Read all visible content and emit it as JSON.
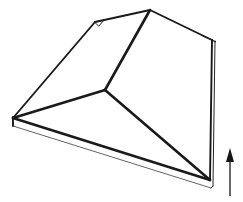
{
  "figure": {
    "title": "Hip roof slab line drawing",
    "type": "line-drawing",
    "background_color": "#ffffff",
    "line_color": "#1a1a1a",
    "canvas": {
      "width": 243,
      "height": 202
    },
    "annotation": {
      "arrow_direction": "up",
      "arrow_label": "",
      "arrow_color": "#161616",
      "arrow_x": 230,
      "arrow_tail_y": 196,
      "arrow_tip_y": 150
    },
    "geometry": {
      "apex": [
        150,
        10
      ],
      "ridge_junction": [
        105,
        90
      ],
      "left_corner": [
        13,
        118
      ],
      "right_corner": [
        210,
        180
      ],
      "top_left_corner": [
        95,
        22
      ],
      "top_right_corner": [
        212,
        40
      ],
      "slab_thickness": 8,
      "edges": [
        {
          "name": "roof-left-rake",
          "from": [
            13,
            118
          ],
          "to": [
            95,
            22
          ]
        },
        {
          "name": "roof-top-left-eave",
          "from": [
            95,
            22
          ],
          "to": [
            150,
            10
          ]
        },
        {
          "name": "roof-top-right-eave",
          "from": [
            150,
            10
          ],
          "to": [
            212,
            40
          ]
        },
        {
          "name": "hip-apex-to-junction",
          "from": [
            150,
            10
          ],
          "to": [
            105,
            90
          ]
        },
        {
          "name": "hip-junction-to-left",
          "from": [
            105,
            90
          ],
          "to": [
            13,
            118
          ]
        },
        {
          "name": "hip-junction-to-right",
          "from": [
            105,
            90
          ],
          "to": [
            210,
            180
          ]
        },
        {
          "name": "slab-front-edge",
          "from": [
            13,
            118
          ],
          "to": [
            210,
            180
          ]
        },
        {
          "name": "slab-right-edge",
          "from": [
            212,
            40
          ],
          "to": [
            210,
            180
          ]
        }
      ]
    }
  }
}
